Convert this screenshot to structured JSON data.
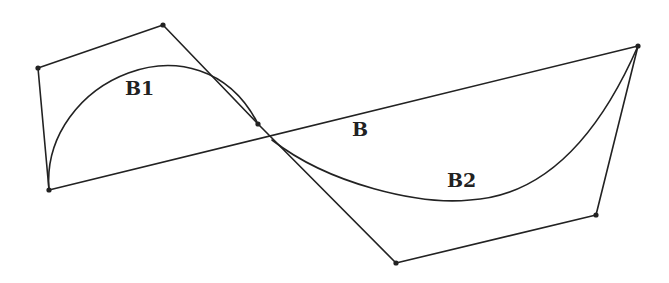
{
  "labels": {
    "b1": "B1",
    "b": "B",
    "b2": "B2"
  },
  "colors": {
    "stroke": "#222222",
    "background": "#ffffff"
  },
  "control_points": [
    {
      "name": "P0",
      "x": 49,
      "y": 190
    },
    {
      "name": "P1",
      "x": 38,
      "y": 68
    },
    {
      "name": "P2",
      "x": 163,
      "y": 25
    },
    {
      "name": "P3",
      "x": 258,
      "y": 124
    },
    {
      "name": "P4",
      "x": 396,
      "y": 263
    },
    {
      "name": "P5",
      "x": 596,
      "y": 215
    },
    {
      "name": "P6",
      "x": 638,
      "y": 46
    }
  ]
}
